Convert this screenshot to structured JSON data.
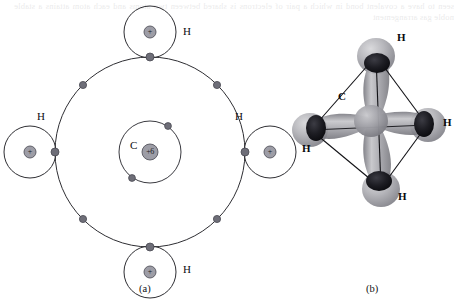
{
  "figure": {
    "title_hidden": "",
    "background_color": "#ffffff",
    "bleed_text": "seen to have a covalent bond in which a pair of electrons is shared between two atoms and each atom attains a stable noble gas arrangement"
  },
  "panel_a": {
    "caption": "(a)",
    "type": "bohr-shell-diagram",
    "molecule": "CH4",
    "center": {
      "x": 150,
      "y": 152
    },
    "carbon": {
      "label": "C",
      "label_x": 133,
      "label_y": 145,
      "nucleus_text": "+6",
      "nucleus_radius": 8,
      "inner_shell_radius": 31,
      "outer_shell_radius": 95,
      "inner_shell_electrons": [
        {
          "angle_deg": 55,
          "x": 168,
          "y": 126
        },
        {
          "angle_deg": 235,
          "x": 132,
          "y": 178
        }
      ],
      "outer_shell_electrons": [
        {
          "angle_deg": 90,
          "x": 150,
          "y": 57
        },
        {
          "angle_deg": 135,
          "x": 83,
          "y": 85
        },
        {
          "angle_deg": 180,
          "x": 55,
          "y": 152
        },
        {
          "angle_deg": 225,
          "x": 83,
          "y": 219
        },
        {
          "angle_deg": 270,
          "x": 150,
          "y": 247
        },
        {
          "angle_deg": 315,
          "x": 217,
          "y": 219
        },
        {
          "angle_deg": 0,
          "x": 245,
          "y": 152
        },
        {
          "angle_deg": 45,
          "x": 217,
          "y": 85
        }
      ]
    },
    "hydrogens": [
      {
        "label": "H",
        "position": "top",
        "cx": 150,
        "cy": 32,
        "shell_radius": 26,
        "nucleus_text": "+",
        "label_x": 183,
        "label_y": 25
      },
      {
        "label": "H",
        "position": "left",
        "cx": 30,
        "cy": 152,
        "shell_radius": 26,
        "nucleus_text": "+",
        "label_x": 37,
        "label_y": 112
      },
      {
        "label": "H",
        "position": "right",
        "cx": 270,
        "cy": 152,
        "shell_radius": 26,
        "nucleus_text": "+",
        "label_x": 235,
        "label_y": 112
      },
      {
        "label": "H",
        "position": "bottom",
        "cx": 150,
        "cy": 272,
        "shell_radius": 26,
        "nucleus_text": "+",
        "label_x": 183,
        "label_y": 264
      }
    ],
    "colors": {
      "shell_line": "#2e2e33",
      "electron_fill": "#6e6e78",
      "nucleus_fill": "#9d9da6",
      "text": "#0d0d11"
    }
  },
  "panel_b": {
    "caption": "(b)",
    "type": "tetrahedral-orbital-model",
    "molecule": "CH4",
    "carbon_label": "C",
    "carbon_label_x": 338,
    "carbon_label_y": 97,
    "center": {
      "x": 370,
      "y": 120
    },
    "hydrogens": [
      {
        "label": "H",
        "position": "top",
        "cx": 376,
        "cy": 56,
        "label_x": 397,
        "label_y": 38
      },
      {
        "label": "H",
        "position": "left",
        "cx": 311,
        "cy": 130,
        "label_x": 302,
        "label_y": 148
      },
      {
        "label": "H",
        "position": "right",
        "cx": 427,
        "cy": 125,
        "label_x": 443,
        "label_y": 122
      },
      {
        "label": "H",
        "position": "bottom",
        "cx": 381,
        "cy": 188,
        "label_x": 398,
        "label_y": 196
      }
    ],
    "colors": {
      "sphere_light": "#b9b9bd",
      "sphere_dark": "#1c1c20",
      "lobe": "#9a9a9f",
      "bond_line": "#111115",
      "text": "#08080c"
    }
  }
}
